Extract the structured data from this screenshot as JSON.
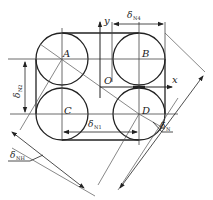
{
  "diagram": {
    "type": "engineering-geometry",
    "points": {
      "A": "A",
      "B": "B",
      "C": "C",
      "D": "D",
      "O": "O"
    },
    "axes": {
      "x": "x",
      "y": "y"
    },
    "dimensions": {
      "top": {
        "symbol": "δ",
        "sub": "N4"
      },
      "left": {
        "symbol": "δ",
        "sub": "N2"
      },
      "middle": {
        "symbol": "δ",
        "sub": "N1"
      },
      "bottom_left": {
        "symbol": "δ",
        "sub": "NH"
      },
      "bottom_right": {
        "symbol": "δ",
        "sub": "N"
      }
    },
    "colors": {
      "line": "#222222",
      "thin_line": "#555555",
      "background": "#ffffff"
    }
  }
}
